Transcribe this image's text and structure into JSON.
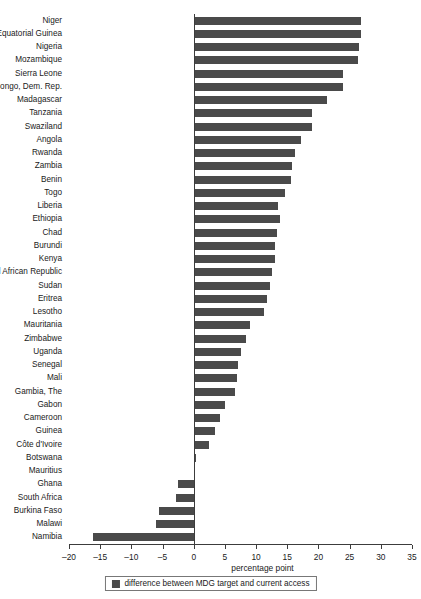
{
  "chart_data": {
    "type": "bar",
    "orientation": "horizontal",
    "title": "",
    "xlabel": "percentage point",
    "ylabel": "",
    "xlim": [
      -20,
      35
    ],
    "xticks": [
      -20,
      -15,
      -10,
      -5,
      0,
      5,
      10,
      15,
      20,
      25,
      30,
      35
    ],
    "xtick_labels": [
      "–20",
      "–15",
      "–10",
      "–5",
      "0",
      "5",
      "10",
      "15",
      "20",
      "25",
      "30",
      "35"
    ],
    "grid": false,
    "legend_position": "bottom",
    "series": [
      {
        "name": "difference between MDG target and current access",
        "color": "#4a4a4a",
        "values": [
          26.8,
          26.8,
          26.5,
          26.3,
          23.9,
          23.9,
          21.3,
          19.0,
          19.0,
          17.2,
          16.2,
          15.7,
          15.6,
          14.6,
          13.5,
          13.8,
          13.3,
          13.0,
          13.0,
          12.5,
          12.2,
          11.7,
          11.2,
          9.1,
          8.4,
          7.6,
          7.1,
          6.9,
          6.6,
          5.0,
          4.2,
          3.4,
          2.5,
          0.3,
          0.0,
          -2.6,
          -2.9,
          -5.5,
          -6.0,
          -16.1
        ]
      }
    ],
    "categories": [
      "Niger",
      "Equatorial Guinea",
      "Nigeria",
      "Mozambique",
      "Sierra Leone",
      "Congo, Dem. Rep.",
      "Madagascar",
      "Tanzania",
      "Swaziland",
      "Angola",
      "Rwanda",
      "Zambia",
      "Benin",
      "Togo",
      "Liberia",
      "Ethiopia",
      "Chad",
      "Burundi",
      "Kenya",
      "Central African Republic",
      "Sudan",
      "Eritrea",
      "Lesotho",
      "Mauritania",
      "Zimbabwe",
      "Uganda",
      "Senegal",
      "Mali",
      "Gambia, The",
      "Gabon",
      "Cameroon",
      "Guinea",
      "Côte d'Ivoire",
      "Botswana",
      "Mauritius",
      "Ghana",
      "South Africa",
      "Burkina Faso",
      "Malawi",
      "Namibia"
    ]
  },
  "legend": {
    "label": "difference between MDG target and current access",
    "swatch_color": "#4a4a4a"
  }
}
